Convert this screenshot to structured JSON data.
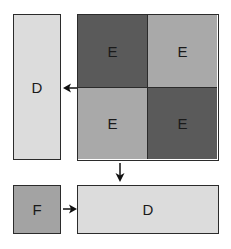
{
  "colors": {
    "light": "#dcdcdc",
    "medium": "#a9a9a9",
    "dark": "#5a5a5a",
    "f_fill": "#a3a3a3",
    "border": "#2b2b2b"
  },
  "diagram": {
    "left_panel": {
      "label": "D"
    },
    "grid": {
      "cells": [
        {
          "label": "E",
          "shade": "dark"
        },
        {
          "label": "E",
          "shade": "medium"
        },
        {
          "label": "E",
          "shade": "medium"
        },
        {
          "label": "E",
          "shade": "dark"
        }
      ]
    },
    "bottom_left": {
      "label": "F"
    },
    "bottom_right": {
      "label": "D"
    },
    "arrows": [
      {
        "from": "grid",
        "to": "left_panel",
        "direction": "left"
      },
      {
        "from": "grid",
        "to": "bottom_right",
        "direction": "down"
      },
      {
        "from": "bottom_left",
        "to": "bottom_right",
        "direction": "right"
      }
    ]
  }
}
